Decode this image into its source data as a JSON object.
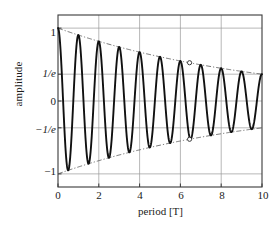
{
  "chart_data": {
    "type": "line",
    "title": "",
    "xlabel": "period [T]",
    "ylabel": "amplitude",
    "xlim": [
      0,
      10
    ],
    "ylim": [
      -1.18,
      1.18
    ],
    "grid": true,
    "legend": false,
    "xticks": [
      "0",
      "2",
      "4",
      "6",
      "8",
      "10"
    ],
    "xtick_values": [
      0,
      2,
      4,
      6,
      8,
      10
    ],
    "yticks": [
      "1",
      "1/e",
      "0",
      "−1/e",
      "−1"
    ],
    "ytick_values": [
      1,
      0.3679,
      0,
      -0.3679,
      -1
    ],
    "series": [
      {
        "name": "damped oscillation",
        "style": "solid",
        "color": "#111111",
        "formula": "exp(-t/10)*cos(2*pi*t)",
        "tau": 10,
        "frequency": 1,
        "x": [
          0,
          0.5,
          1,
          1.5,
          2,
          2.5,
          3,
          3.5,
          4,
          4.5,
          5,
          5.5,
          6,
          6.5,
          7,
          7.5,
          8,
          8.5,
          9,
          9.5,
          10
        ],
        "y": [
          1,
          -0.951,
          0.905,
          -0.861,
          0.819,
          -0.779,
          0.741,
          -0.705,
          0.67,
          -0.638,
          0.607,
          -0.577,
          0.549,
          -0.522,
          0.497,
          -0.472,
          0.449,
          -0.427,
          0.407,
          -0.387,
          0.368
        ]
      },
      {
        "name": "upper envelope",
        "style": "dash-dot",
        "color": "#555555",
        "formula": "exp(-t/10)",
        "x": [
          0,
          2,
          4,
          6,
          8,
          10
        ],
        "y": [
          1,
          0.819,
          0.67,
          0.549,
          0.449,
          0.368
        ]
      },
      {
        "name": "lower envelope",
        "style": "dash-dot",
        "color": "#555555",
        "formula": "-exp(-t/10)",
        "x": [
          0,
          2,
          4,
          6,
          8,
          10
        ],
        "y": [
          -1,
          -0.819,
          -0.67,
          -0.549,
          -0.449,
          -0.368
        ]
      }
    ],
    "markers": [
      {
        "name": "upper-envelope-marker",
        "x": 6.45,
        "y": 0.525,
        "shape": "open-circle"
      },
      {
        "name": "lower-envelope-marker",
        "x": 6.45,
        "y": -0.525,
        "shape": "open-circle"
      }
    ],
    "annotations": []
  }
}
